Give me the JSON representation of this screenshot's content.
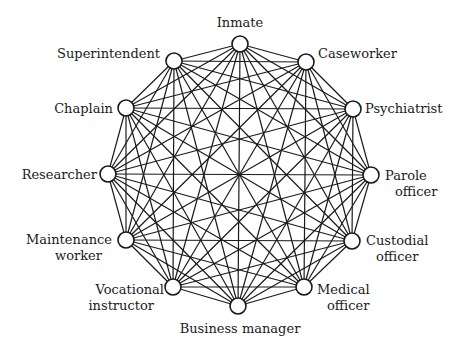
{
  "diagram": {
    "type": "complete-graph",
    "center": [
      240,
      175
    ],
    "node_radius": 8,
    "colors": {
      "line": "#1a1a1a",
      "node_fill": "#ffffff",
      "background": "#ffffff"
    },
    "nodes": [
      {
        "id": "inmate",
        "lines": [
          "Inmate"
        ],
        "x": 240,
        "y": 44,
        "lx": 240,
        "ly": 27,
        "anchor": "middle"
      },
      {
        "id": "caseworker",
        "lines": [
          "Caseworker"
        ],
        "x": 306,
        "y": 62,
        "lx": 318,
        "ly": 58,
        "anchor": "start"
      },
      {
        "id": "psychiatrist",
        "lines": [
          "Psychiatrist"
        ],
        "x": 353,
        "y": 109,
        "lx": 365,
        "ly": 113,
        "anchor": "start"
      },
      {
        "id": "parole-officer",
        "lines": [
          "Parole",
          "officer"
        ],
        "x": 371,
        "y": 175,
        "lx": 385,
        "ly": 180,
        "anchor": "start"
      },
      {
        "id": "custodial-officer",
        "lines": [
          "Custodial",
          "officer"
        ],
        "x": 352,
        "y": 241,
        "lx": 366,
        "ly": 245,
        "anchor": "start"
      },
      {
        "id": "medical-officer",
        "lines": [
          "Medical",
          "officer"
        ],
        "x": 304,
        "y": 287,
        "lx": 317,
        "ly": 294,
        "anchor": "start"
      },
      {
        "id": "business-manager",
        "lines": [
          "Business manager"
        ],
        "x": 238,
        "y": 306,
        "lx": 240,
        "ly": 333,
        "anchor": "middle"
      },
      {
        "id": "vocational-instructor",
        "lines": [
          "Vocational",
          "instructor"
        ],
        "x": 173,
        "y": 287,
        "lx": 164,
        "ly": 294,
        "anchor": "end"
      },
      {
        "id": "maintenance-worker",
        "lines": [
          "Maintenance",
          "worker"
        ],
        "x": 126,
        "y": 240,
        "lx": 112,
        "ly": 244,
        "anchor": "end"
      },
      {
        "id": "researcher",
        "lines": [
          "Researcher"
        ],
        "x": 108,
        "y": 174,
        "lx": 97,
        "ly": 179,
        "anchor": "end"
      },
      {
        "id": "chaplain",
        "lines": [
          "Chaplain"
        ],
        "x": 126,
        "y": 108,
        "lx": 113,
        "ly": 113,
        "anchor": "end"
      },
      {
        "id": "superintendent",
        "lines": [
          "Superintendent"
        ],
        "x": 174,
        "y": 61,
        "lx": 160,
        "ly": 58,
        "anchor": "end"
      }
    ]
  }
}
